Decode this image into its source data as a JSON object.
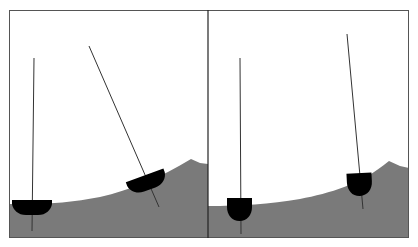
{
  "figure": {
    "colors": {
      "background": "#ffffff",
      "water": "#7a7a7a",
      "hull": "#000000",
      "mast": "#333333",
      "frame": "#555555",
      "divider": "#222222"
    },
    "panels": [
      {
        "id": "left",
        "hull_type": "wide-shallow",
        "boats": [
          {
            "position": "trough",
            "tilt": "upright"
          },
          {
            "position": "wave-slope",
            "tilt": "tilted-with-slope"
          }
        ]
      },
      {
        "id": "right",
        "hull_type": "deep-round",
        "boats": [
          {
            "position": "trough",
            "tilt": "upright"
          },
          {
            "position": "wave-slope",
            "tilt": "nearly-upright"
          }
        ]
      }
    ]
  }
}
